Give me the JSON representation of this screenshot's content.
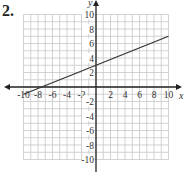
{
  "problem": {
    "number": "2."
  },
  "chart_data": {
    "type": "line",
    "title": "",
    "xlabel": "x",
    "ylabel": "y",
    "xlim": [
      -10,
      10
    ],
    "ylim": [
      -10,
      10
    ],
    "grid": true,
    "grid_step": 1,
    "x_ticks": [
      -10,
      -8,
      -6,
      -4,
      -2,
      2,
      4,
      6,
      8,
      10
    ],
    "y_ticks": [
      10,
      8,
      6,
      4,
      2,
      -2,
      -4,
      -6,
      -8,
      -10
    ],
    "series": [
      {
        "name": "line",
        "equation": "y = 0.4x + 3",
        "x": [
          -10,
          10
        ],
        "y": [
          -1,
          7
        ]
      }
    ],
    "annotations": []
  },
  "colors": {
    "grid": "#c8c8c8",
    "axis": "#222222",
    "line": "#333333"
  }
}
